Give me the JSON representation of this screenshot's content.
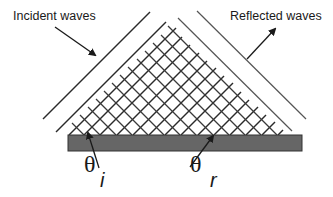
{
  "diagram": {
    "labels": {
      "incident": "Incident waves",
      "reflected": "Reflected waves",
      "theta_symbol": "θ",
      "incident_subscript": "i",
      "reflected_subscript": "r"
    },
    "colors": {
      "line": "#2a2a2a",
      "surface_fill": "#666666",
      "surface_stroke": "#333333",
      "text": "#1a1a1a"
    },
    "elements": [
      {
        "id": "incident-wavefronts",
        "type": "parallel-lines",
        "direction": "lower-left to upper-right"
      },
      {
        "id": "reflected-wavefronts",
        "type": "parallel-lines",
        "direction": "upper-left to lower-right"
      },
      {
        "id": "surface",
        "type": "rectangle"
      },
      {
        "id": "incident-arrow",
        "points_to": "incident-wavefronts"
      },
      {
        "id": "reflected-arrow",
        "points_from": "reflected-wavefronts"
      },
      {
        "id": "theta-i-arrow",
        "points_to": "incident angle at surface"
      },
      {
        "id": "theta-r-arrow",
        "points_to": "reflected angle at surface"
      }
    ]
  }
}
